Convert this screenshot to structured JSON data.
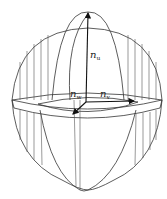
{
  "figure": {
    "type": "3d-local-frame-on-ellipsoid",
    "stroke_color": "#333333",
    "background": "#ffffff",
    "vectors": [
      {
        "id": "n_u",
        "base": "n",
        "sub": "u",
        "direction": "up"
      },
      {
        "id": "n_v",
        "base": "n",
        "sub": "v",
        "direction": "right"
      },
      {
        "id": "n_w",
        "base": "n",
        "sub": "w",
        "direction": "toward-viewer (down-left)"
      }
    ]
  },
  "labels": {
    "nu_base": "n",
    "nu_sub": "u",
    "nv_base": "n",
    "nv_sub": "v",
    "nw_base": "n",
    "nw_sub": "w"
  }
}
